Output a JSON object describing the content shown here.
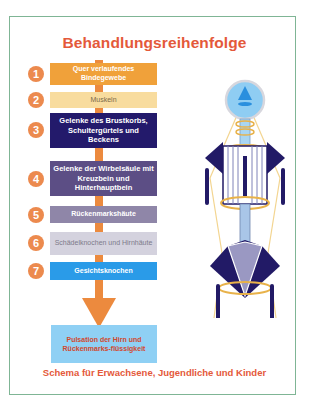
{
  "title": "Behandlungsreihenfolge",
  "steps": [
    {
      "number": "1",
      "label": "Quer verlaufendes Bindegewebe",
      "bg": "#f0a13a",
      "fg": "#ffffff"
    },
    {
      "number": "2",
      "label": "Muskeln",
      "bg": "#f8dc9e",
      "fg": "#7a6a4a"
    },
    {
      "number": "3",
      "label": "Gelenke des Brustkorbs, Schultergürtels und Beckens",
      "bg": "#231a6b",
      "fg": "#ffffff"
    },
    {
      "number": "4",
      "label": "Gelenke der Wirbelsäule mit Kreuzbein und Hinterhauptbein",
      "bg": "#5c4e85",
      "fg": "#ffffff"
    },
    {
      "number": "5",
      "label": "Rückenmarkshäute",
      "bg": "#8f86a8",
      "fg": "#ffffff"
    },
    {
      "number": "6",
      "label": "Schädelknochen und Hirnhäute",
      "bg": "#d4d2de",
      "fg": "#7d7a8a"
    },
    {
      "number": "7",
      "label": "Gesichtsknochen",
      "bg": "#2a9be8",
      "fg": "#ffffff"
    }
  ],
  "result": {
    "label": "Pulsation der Hirn und Rückenmarks-flüssigkeit",
    "bg": "#8fd0f4",
    "fg": "#d2482e"
  },
  "footer": "Schema für Erwachsene, Jugendliche und Kinder",
  "colors": {
    "accent": "#e4593a",
    "spine": "#ec8a3e",
    "frame": "#7fb595",
    "figure_navy": "#221a66",
    "figure_gold": "#e8b24a",
    "figure_lightblue": "#8fcdf3"
  }
}
